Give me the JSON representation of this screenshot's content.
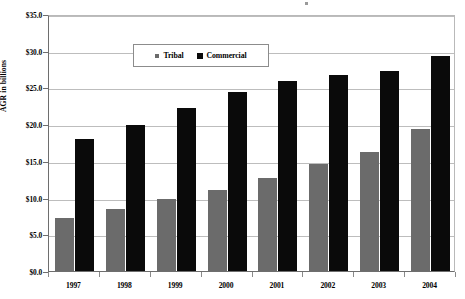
{
  "chart_data": {
    "type": "bar",
    "title": "",
    "xlabel": "",
    "ylabel": "AGR in billions",
    "categories": [
      "1997",
      "1998",
      "1999",
      "2000",
      "2001",
      "2002",
      "2003",
      "2004"
    ],
    "series": [
      {
        "name": "Tribal",
        "color": "#6b6b6b",
        "values": [
          7.2,
          8.5,
          9.8,
          11.0,
          12.7,
          14.6,
          16.2,
          19.3
        ]
      },
      {
        "name": "Commercial",
        "color": "#0a0a0a",
        "values": [
          18.0,
          19.9,
          22.2,
          24.4,
          25.9,
          26.7,
          27.3,
          29.3
        ]
      }
    ],
    "ylim": [
      0,
      35
    ],
    "ystep": 5,
    "ytick_labels": [
      "$0.0",
      "$5.0",
      "$10.0",
      "$15.0",
      "$20.0",
      "$25.0",
      "$30.0",
      "$35.0"
    ],
    "grid": true,
    "legend_position": "top-center",
    "legend_entries": [
      "Tribal",
      "Commercial"
    ]
  }
}
